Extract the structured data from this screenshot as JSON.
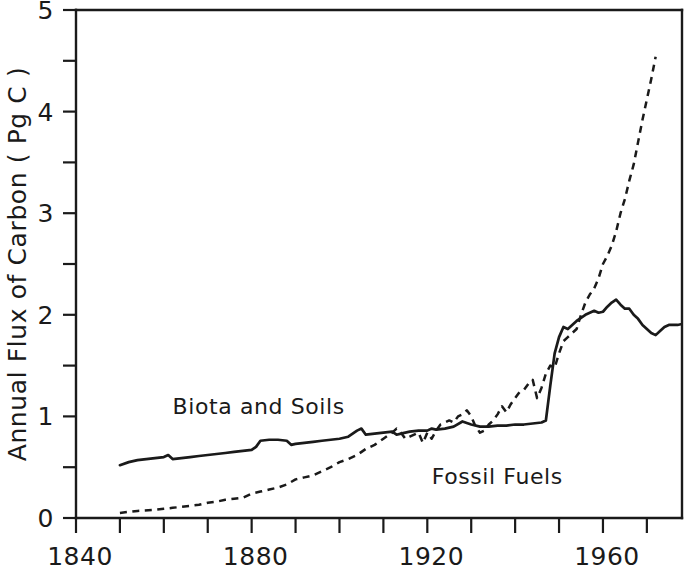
{
  "chart_data": {
    "type": "line",
    "title": "",
    "xlabel": "",
    "ylabel": "Annual Flux of Carbon ( Pg C )",
    "xlim": [
      1840,
      1978
    ],
    "ylim": [
      0,
      5
    ],
    "grid": false,
    "legend_position": "inline-annotation",
    "x_ticks_major": [
      1840,
      1880,
      1920,
      1960
    ],
    "x_tick_labels": [
      "1840",
      "1880",
      "1920",
      "1960"
    ],
    "x_ticks_minor": [
      1850,
      1860,
      1870,
      1890,
      1900,
      1910,
      1930,
      1940,
      1950,
      1970
    ],
    "y_ticks_major": [
      0,
      1,
      2,
      3,
      4,
      5
    ],
    "y_tick_labels": [
      "0",
      "1",
      "2",
      "3",
      "4",
      "5"
    ],
    "y_ticks_minor": [
      0.5,
      1.5,
      2.5,
      3.5,
      4.5
    ],
    "series": [
      {
        "name": "Biota and Soils",
        "style": "solid",
        "label_x": 1862,
        "label_y": 1.02,
        "x": [
          1850,
          1852,
          1854,
          1856,
          1858,
          1860,
          1861,
          1862,
          1864,
          1866,
          1868,
          1870,
          1872,
          1874,
          1876,
          1878,
          1880,
          1881,
          1882,
          1884,
          1886,
          1888,
          1889,
          1890,
          1892,
          1894,
          1896,
          1898,
          1900,
          1902,
          1904,
          1905,
          1906,
          1908,
          1910,
          1912,
          1913,
          1914,
          1916,
          1918,
          1920,
          1921,
          1922,
          1924,
          1926,
          1928,
          1930,
          1932,
          1934,
          1936,
          1938,
          1940,
          1942,
          1944,
          1946,
          1947,
          1948,
          1949,
          1950,
          1951,
          1952,
          1953,
          1954,
          1956,
          1958,
          1959,
          1960,
          1961,
          1962,
          1963,
          1964,
          1965,
          1966,
          1967,
          1968,
          1969,
          1970,
          1971,
          1972,
          1973,
          1974,
          1975,
          1976,
          1977,
          1978
        ],
        "y": [
          0.52,
          0.55,
          0.57,
          0.58,
          0.59,
          0.6,
          0.62,
          0.58,
          0.59,
          0.6,
          0.61,
          0.62,
          0.63,
          0.64,
          0.65,
          0.66,
          0.67,
          0.7,
          0.76,
          0.77,
          0.77,
          0.76,
          0.72,
          0.73,
          0.74,
          0.75,
          0.76,
          0.77,
          0.78,
          0.8,
          0.86,
          0.88,
          0.82,
          0.83,
          0.84,
          0.85,
          0.82,
          0.83,
          0.85,
          0.86,
          0.86,
          0.88,
          0.87,
          0.88,
          0.9,
          0.95,
          0.92,
          0.9,
          0.9,
          0.91,
          0.91,
          0.92,
          0.92,
          0.93,
          0.94,
          0.96,
          1.3,
          1.62,
          1.78,
          1.88,
          1.86,
          1.9,
          1.94,
          2.0,
          2.04,
          2.02,
          2.03,
          2.08,
          2.12,
          2.15,
          2.1,
          2.06,
          2.06,
          2.0,
          1.96,
          1.9,
          1.86,
          1.82,
          1.8,
          1.84,
          1.88,
          1.9,
          1.9,
          1.9,
          1.91
        ]
      },
      {
        "name": "Fossil Fuels",
        "style": "dashed",
        "label_x": 1921,
        "label_y": 0.33,
        "x": [
          1850,
          1854,
          1858,
          1860,
          1862,
          1864,
          1866,
          1868,
          1870,
          1872,
          1874,
          1876,
          1878,
          1880,
          1882,
          1884,
          1886,
          1888,
          1890,
          1892,
          1894,
          1896,
          1898,
          1900,
          1902,
          1904,
          1906,
          1908,
          1910,
          1912,
          1913,
          1914,
          1915,
          1916,
          1917,
          1918,
          1919,
          1920,
          1921,
          1922,
          1923,
          1924,
          1925,
          1926,
          1927,
          1928,
          1929,
          1930,
          1931,
          1932,
          1933,
          1934,
          1935,
          1936,
          1937,
          1938,
          1939,
          1940,
          1941,
          1942,
          1943,
          1944,
          1945,
          1946,
          1947,
          1948,
          1949,
          1950,
          1951,
          1952,
          1953,
          1954,
          1955,
          1956,
          1957,
          1958,
          1959,
          1960,
          1961,
          1962,
          1963,
          1964,
          1965,
          1966,
          1967,
          1968,
          1969,
          1970,
          1971,
          1972
        ],
        "y": [
          0.05,
          0.07,
          0.08,
          0.09,
          0.1,
          0.11,
          0.12,
          0.13,
          0.15,
          0.16,
          0.18,
          0.19,
          0.2,
          0.24,
          0.26,
          0.28,
          0.3,
          0.33,
          0.38,
          0.4,
          0.42,
          0.46,
          0.5,
          0.55,
          0.58,
          0.62,
          0.68,
          0.72,
          0.78,
          0.84,
          0.88,
          0.84,
          0.78,
          0.8,
          0.82,
          0.84,
          0.74,
          0.84,
          0.78,
          0.86,
          0.92,
          0.94,
          0.96,
          0.94,
          1.0,
          1.02,
          1.06,
          1.0,
          0.9,
          0.84,
          0.86,
          0.92,
          0.96,
          1.02,
          1.1,
          1.04,
          1.12,
          1.18,
          1.24,
          1.26,
          1.32,
          1.36,
          1.18,
          1.28,
          1.42,
          1.5,
          1.48,
          1.62,
          1.74,
          1.78,
          1.82,
          1.86,
          2.0,
          2.12,
          2.2,
          2.26,
          2.36,
          2.5,
          2.58,
          2.68,
          2.82,
          3.0,
          3.14,
          3.32,
          3.48,
          3.7,
          3.92,
          4.12,
          4.32,
          4.54
        ]
      }
    ]
  }
}
